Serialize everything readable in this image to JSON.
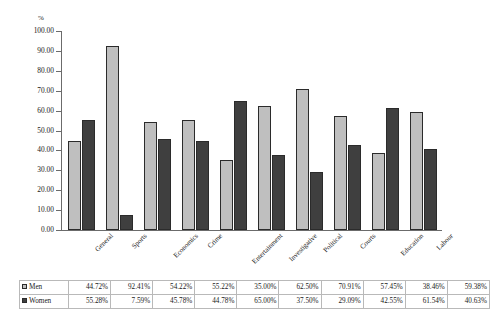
{
  "chart_data": {
    "type": "bar",
    "title": "",
    "subtitle": "",
    "xlabel": "",
    "ylabel": "%",
    "unit_label": "%",
    "ylim": [
      0,
      100
    ],
    "ytick_step": 10,
    "ytick_labels": [
      "100.00",
      "90.00",
      "80.00",
      "70.00",
      "60.00",
      "50.00",
      "40.00",
      "30.00",
      "20.00",
      "10.00",
      "0.00"
    ],
    "ytick_values": [
      100,
      90,
      80,
      70,
      60,
      50,
      40,
      30,
      20,
      10,
      0
    ],
    "grid": false,
    "legend_position": "table-below",
    "orientation": "vertical",
    "grouping": "clustered",
    "categories": [
      "General",
      "Sports",
      "Economics",
      "Crime",
      "Entertainment",
      "Investigative",
      "Political",
      "Courts",
      "Education",
      "Labour"
    ],
    "series": [
      {
        "name": "Men",
        "color": "#bfbfbf",
        "values": [
          44.72,
          92.41,
          54.22,
          55.22,
          35.0,
          62.5,
          70.91,
          57.45,
          38.46,
          59.38
        ],
        "labels": [
          "44.72%",
          "92.41%",
          "54.22%",
          "55.22%",
          "35.00%",
          "62.50%",
          "70.91%",
          "57.45%",
          "38.46%",
          "59.38%"
        ]
      },
      {
        "name": "Women",
        "color": "#3f3f3f",
        "values": [
          55.28,
          7.59,
          45.78,
          44.78,
          65.0,
          37.5,
          29.09,
          42.55,
          61.54,
          40.63
        ],
        "labels": [
          "55.28%",
          "7.59%",
          "45.78%",
          "44.78%",
          "65.00%",
          "37.50%",
          "29.09%",
          "42.55%",
          "61.54%",
          "40.63%"
        ]
      }
    ]
  },
  "table": {
    "row_header_men": "Men",
    "row_header_women": "Women"
  },
  "colors": {
    "men": "#bfbfbf",
    "women": "#3f3f3f",
    "axis": "#6b6b6b",
    "bar_outline": "#2b2b2b",
    "table_border": "#b9b9b9",
    "background": "#ffffff"
  }
}
